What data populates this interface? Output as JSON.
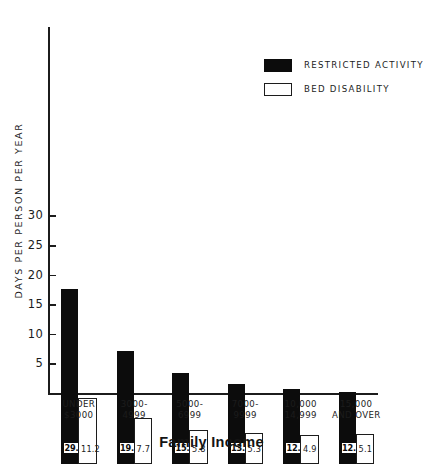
{
  "chart_data": {
    "type": "bar",
    "title": "",
    "xlabel": "Family Income",
    "ylabel": "DAYS PER PERSON PER YEAR",
    "ylim": [
      0,
      32
    ],
    "yticks": [
      5,
      10,
      15,
      20,
      25,
      30
    ],
    "ytick_labels": [
      "5",
      "10",
      "15",
      "20",
      "25",
      "30"
    ],
    "grid": false,
    "legend_position": "upper-right",
    "categories": [
      "UNDER $3000",
      "3000-4999",
      "5000-6999",
      "7000-9999",
      "10,000 14,999",
      "15,000 AND OVER"
    ],
    "category_lines": [
      [
        "UNDER",
        "$3000"
      ],
      [
        "3000-",
        "4999"
      ],
      [
        "5000-",
        "6999"
      ],
      [
        "7000-",
        "9999"
      ],
      [
        "10,000",
        "14,999"
      ],
      [
        "15,000",
        "AND OVER"
      ]
    ],
    "series": [
      {
        "name": "RESTRICTED ACTIVITY",
        "color": "#0c0c0c",
        "values": [
          29.6,
          19.1,
          15.4,
          13.5,
          12.6,
          12.1
        ],
        "labels": [
          "29.6",
          "19.1",
          "15.4",
          "13.5",
          "12.6",
          "12.1"
        ]
      },
      {
        "name": "BED DISABILITY",
        "color": "#ffffff",
        "values": [
          11.2,
          7.7,
          5.8,
          5.3,
          4.9,
          5.1
        ],
        "labels": [
          "11.2",
          "7.7",
          "5.8",
          "5.3",
          "4.9",
          "5.1"
        ]
      }
    ]
  },
  "legend": {
    "items": [
      {
        "label": "RESTRICTED ACTIVITY",
        "style": "dark"
      },
      {
        "label": "BED DISABILITY",
        "style": "light"
      }
    ]
  },
  "axis_titles": {
    "x": "Family Income",
    "y": "DAYS PER PERSON PER YEAR"
  }
}
